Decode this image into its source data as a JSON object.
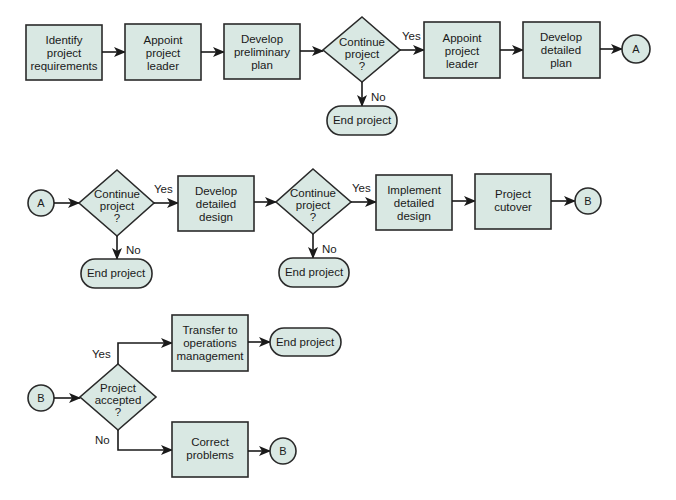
{
  "diagram": {
    "type": "flowchart",
    "colors": {
      "node_fill": "#d9e8e3",
      "stroke": "#2a2a2a",
      "background": "#ffffff"
    },
    "row1": {
      "identify": [
        "Identify",
        "project",
        "requirements"
      ],
      "appoint1": [
        "Appoint",
        "project",
        "leader"
      ],
      "prelim": [
        "Develop",
        "preliminary",
        "plan"
      ],
      "decision1": [
        "Continue",
        "project",
        "?"
      ],
      "yes1": "Yes",
      "no1": "No",
      "end1": "End project",
      "appoint2": [
        "Appoint",
        "project",
        "leader"
      ],
      "detailed_plan": [
        "Develop",
        "detailed",
        "plan"
      ],
      "connector_a": "A"
    },
    "row2": {
      "connector_a": "A",
      "decision2": [
        "Continue",
        "project",
        "?"
      ],
      "yes2": "Yes",
      "no2": "No",
      "end2": "End project",
      "detailed_design": [
        "Develop",
        "detailed",
        "design"
      ],
      "decision3": [
        "Continue",
        "project",
        "?"
      ],
      "yes3": "Yes",
      "no3": "No",
      "end3": "End project",
      "implement": [
        "Implement",
        "detailed",
        "design"
      ],
      "cutover": [
        "Project",
        "cutover"
      ],
      "connector_b": "B"
    },
    "row3": {
      "connector_b": "B",
      "decision4": [
        "Project",
        "accepted",
        "?"
      ],
      "yes4": "Yes",
      "no4": "No",
      "transfer": [
        "Transfer to",
        "operations",
        "management"
      ],
      "end4": "End project",
      "correct": [
        "Correct",
        "problems"
      ],
      "connector_b2": "B"
    }
  }
}
